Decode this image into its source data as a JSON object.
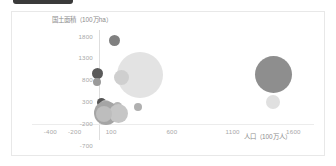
{
  "window": {
    "top_bar_present": true,
    "background_color": "#ffffff",
    "frame_border_color": "#e8e8e8"
  },
  "chart_data": {
    "type": "scatter",
    "title": "",
    "subtitle": "",
    "xlabel": "人口（100万人）",
    "ylabel": "国土面積（100万ha）",
    "xlim": [
      -400,
      1850
    ],
    "ylim": [
      -700,
      1900
    ],
    "xticks": [
      -400,
      -200,
      100,
      600,
      1100,
      1600
    ],
    "xticklabels": [
      "-400",
      "-200",
      "100",
      "600",
      "1100",
      "1600"
    ],
    "yticks": [
      1800,
      1300,
      800,
      300,
      -200,
      -700
    ],
    "yticklabels": [
      "1800",
      "1300",
      "800",
      "300",
      "-200",
      "-700"
    ],
    "grid": false,
    "legend": false,
    "legend_position": "none",
    "axis_line_color": "#dedede",
    "tick_label_color": "#a8a8a8",
    "axis_title_color": "#8c8c8c",
    "points": [
      {
        "name": "point-1",
        "x": 130,
        "y": 1720,
        "size": 11,
        "color": "#808080"
      },
      {
        "name": "point-2",
        "x": -10,
        "y": 950,
        "size": 11,
        "color": "#5a5a5a"
      },
      {
        "name": "point-3",
        "x": -15,
        "y": 755,
        "size": 8,
        "color": "#9a9a9a"
      },
      {
        "name": "point-4",
        "x": 340,
        "y": 930,
        "size": 46,
        "color": "#e3e3e3",
        "striped": true
      },
      {
        "name": "point-5",
        "x": 185,
        "y": 855,
        "size": 15,
        "color": "#cfcfcf"
      },
      {
        "name": "point-6",
        "x": 1440,
        "y": 930,
        "size": 37,
        "color": "#8e8e8e"
      },
      {
        "name": "point-7",
        "x": 1430,
        "y": 300,
        "size": 14,
        "color": "#e0e0e0"
      },
      {
        "name": "point-8",
        "x": 20,
        "y": 300,
        "size": 9,
        "color": "#555555"
      },
      {
        "name": "point-9",
        "x": 55,
        "y": 205,
        "size": 13,
        "color": "#bfbfbf"
      },
      {
        "name": "point-10",
        "x": 150,
        "y": 195,
        "size": 9,
        "color": "#b5b5b5"
      },
      {
        "name": "point-11",
        "x": 320,
        "y": 180,
        "size": 8,
        "color": "#b0b0b0"
      },
      {
        "name": "point-12",
        "x": 55,
        "y": 55,
        "size": 24,
        "color": "#a5a5a5"
      },
      {
        "name": "point-13",
        "x": 160,
        "y": 45,
        "size": 19,
        "color": "#c6c6c6"
      },
      {
        "name": "point-14",
        "x": 40,
        "y": 20,
        "size": 16,
        "color": "#bdbdbd"
      }
    ]
  }
}
